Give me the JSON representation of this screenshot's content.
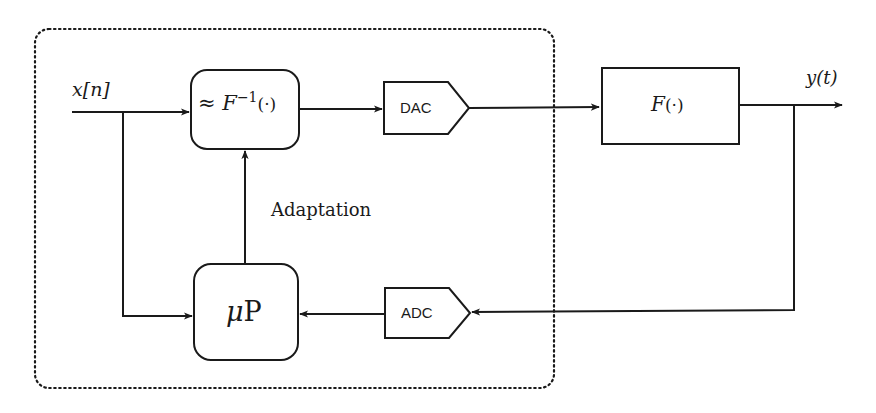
{
  "diagram": {
    "type": "block-diagram",
    "title": "",
    "input_label": "x[n]",
    "output_label": "y(t)",
    "adaptation_label": "Adaptation",
    "blocks": {
      "predistorter": {
        "approx": "≈",
        "func": "F",
        "sup": "−1",
        "arg": "(·)"
      },
      "dac": {
        "label": "DAC"
      },
      "plant": {
        "func": "F",
        "arg": "(·)"
      },
      "processor": {
        "mu": "μ",
        "p": "P"
      },
      "adc": {
        "label": "ADC"
      }
    },
    "edges": [
      {
        "from": "x[n]",
        "to": "predistorter"
      },
      {
        "from": "predistorter",
        "to": "dac"
      },
      {
        "from": "dac",
        "to": "plant"
      },
      {
        "from": "plant",
        "to": "y(t)"
      },
      {
        "from": "x[n]",
        "to": "processor"
      },
      {
        "from": "y(t)",
        "to": "adc"
      },
      {
        "from": "adc",
        "to": "processor"
      },
      {
        "from": "processor",
        "to": "predistorter",
        "label": "Adaptation"
      }
    ],
    "group": {
      "style": "dotted",
      "contains": [
        "predistorter",
        "dac",
        "processor",
        "adc"
      ]
    },
    "colors": {
      "stroke": "#1a1a1a",
      "background": "#ffffff"
    }
  }
}
